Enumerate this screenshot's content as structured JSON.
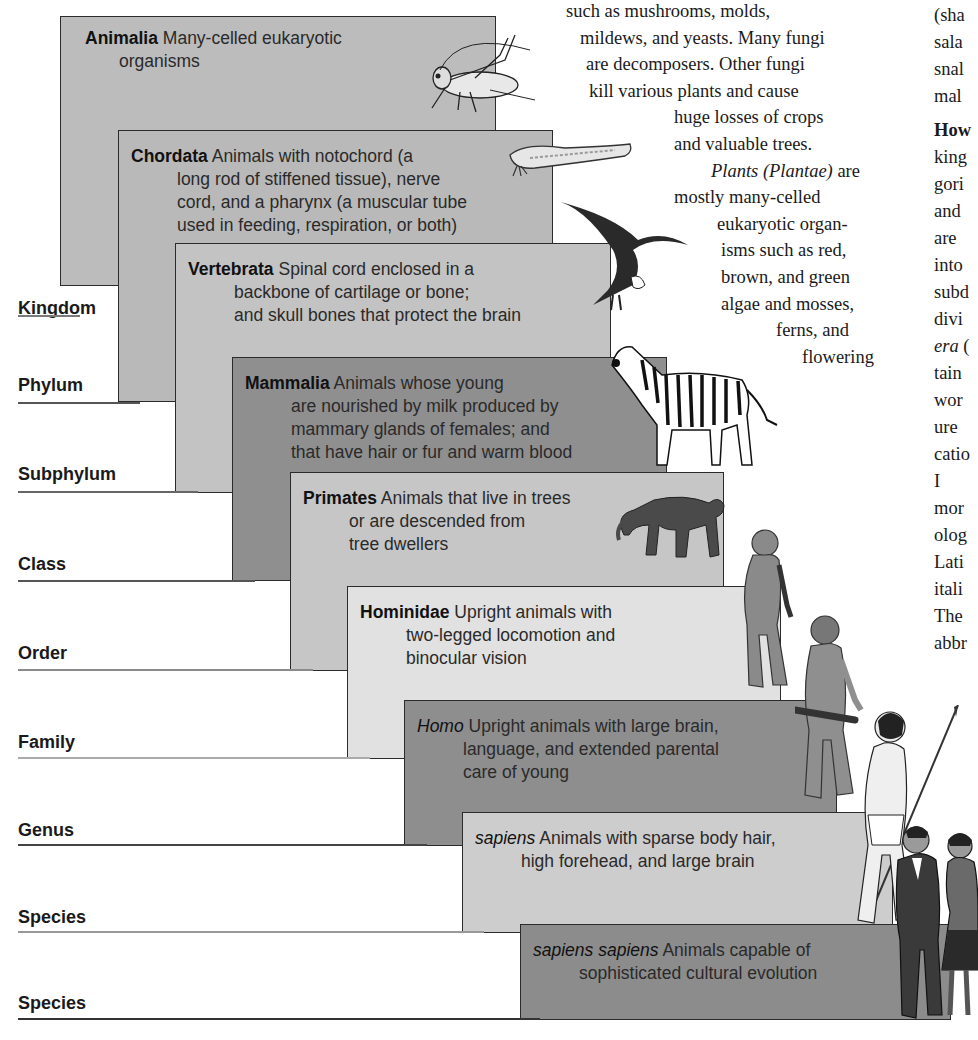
{
  "ranks": [
    {
      "label": "Kingdom",
      "y": 298,
      "underline_y": 315,
      "underline_w": 30,
      "underline_color": "#7a7a7a"
    },
    {
      "label": "Phylum",
      "y": 375,
      "underline_y": 402,
      "underline_w": 90,
      "underline_color": "#555555"
    },
    {
      "label": "Subphylum",
      "y": 464,
      "underline_y": 491,
      "underline_w": 148,
      "underline_color": "#666666"
    },
    {
      "label": "Class",
      "y": 554,
      "underline_y": 580,
      "underline_w": 205,
      "underline_color": "#555555"
    },
    {
      "label": "Order",
      "y": 643,
      "underline_y": 669,
      "underline_w": 263,
      "underline_color": "#8a8a8a"
    },
    {
      "label": "Family",
      "y": 732,
      "underline_y": 757,
      "underline_w": 320,
      "underline_color": "#aaaaaa"
    },
    {
      "label": "Genus",
      "y": 820,
      "underline_y": 844,
      "underline_w": 377,
      "underline_color": "#444444"
    },
    {
      "label": "Species",
      "y": 907,
      "underline_y": 931,
      "underline_w": 434,
      "underline_color": "#999999"
    },
    {
      "label": "Species",
      "y": 993,
      "underline_y": 1018,
      "underline_w": 490,
      "underline_color": "#333333"
    }
  ],
  "boxes": [
    {
      "term": "Animalia",
      "italic": false,
      "lines": [
        "Many-celled eukaryotic",
        "organisms"
      ],
      "x": 60,
      "y": 16,
      "w": 436,
      "h": 270,
      "fill": "#bcbcbc"
    },
    {
      "term": "Chordata",
      "italic": false,
      "lines": [
        "Animals with notochord (a",
        "long rod of stiffened tissue), nerve",
        "cord, and a pharynx (a muscular tube",
        "used in feeding, respiration, or both)"
      ],
      "x": 118,
      "y": 130,
      "w": 435,
      "h": 272,
      "fill": "#b9b9b9"
    },
    {
      "term": "Vertebrata",
      "italic": false,
      "lines": [
        "Spinal cord enclosed in a",
        "backbone of cartilage or bone;",
        "and skull bones that protect the brain"
      ],
      "x": 175,
      "y": 243,
      "w": 436,
      "h": 250,
      "fill": "#c3c3c3"
    },
    {
      "term": "Mammalia",
      "italic": false,
      "lines": [
        "Animals whose young",
        "are nourished by milk produced by",
        "mammary glands of females; and",
        "that have hair or fur and warm blood"
      ],
      "x": 232,
      "y": 357,
      "w": 435,
      "h": 224,
      "fill": "#8f8f8f"
    },
    {
      "term": "Primates",
      "italic": false,
      "lines": [
        "Animals that live in trees",
        "or are descended from",
        "tree dwellers"
      ],
      "x": 290,
      "y": 472,
      "w": 434,
      "h": 199,
      "fill": "#c6c6c6"
    },
    {
      "term": "Hominidae",
      "italic": false,
      "lines": [
        "Upright animals with",
        "two-legged locomotion and",
        "binocular vision"
      ],
      "x": 347,
      "y": 586,
      "w": 434,
      "h": 173,
      "fill": "#e1e1e1"
    },
    {
      "term": "Homo",
      "italic": true,
      "lines": [
        "Upright animals with large brain,",
        "language, and extended parental",
        "care of young"
      ],
      "x": 404,
      "y": 700,
      "w": 433,
      "h": 146,
      "fill": "#8e8e8e"
    },
    {
      "term": "sapiens",
      "italic": true,
      "lines": [
        "Animals with sparse body hair,",
        "high forehead, and large brain"
      ],
      "x": 462,
      "y": 812,
      "w": 431,
      "h": 121,
      "fill": "#cdcdcd"
    },
    {
      "term": "sapiens sapiens",
      "italic": true,
      "lines": [
        "Animals capable of",
        "sophisticated cultural evolution"
      ],
      "x": 520,
      "y": 924,
      "w": 431,
      "h": 96,
      "fill": "#8c8c8c"
    }
  ],
  "center_text": {
    "lines": [
      {
        "text": "such as mushrooms, molds,",
        "x": 566
      },
      {
        "text": "mildews, and yeasts. Many fungi",
        "x": 580
      },
      {
        "text": "are decomposers. Other fungi",
        "x": 586
      },
      {
        "text": "kill various plants and cause",
        "x": 589
      },
      {
        "text": "huge losses of crops",
        "x": 674
      },
      {
        "text": "and valuable trees.",
        "x": 674
      },
      {
        "text_it": "Plants (Plantae)",
        "text_rest": " are",
        "x": 711
      },
      {
        "text": "mostly many-celled",
        "x": 674
      },
      {
        "text": "eukaryotic organ-",
        "x": 717
      },
      {
        "text": "isms such as red,",
        "x": 721
      },
      {
        "text": "brown, and green",
        "x": 721
      },
      {
        "text": "algae and mosses,",
        "x": 721
      },
      {
        "text": "ferns, and",
        "x": 776
      },
      {
        "text": "flowering",
        "x": 802
      }
    ]
  },
  "right_text": {
    "lines": [
      {
        "text": "(sha",
        "y": 2
      },
      {
        "text": "sala",
        "y": 29
      },
      {
        "text": "snal",
        "y": 56
      },
      {
        "text": "mal",
        "y": 83
      },
      {
        "text_bold": "How",
        "y": 117
      },
      {
        "text": "king",
        "y": 144
      },
      {
        "text": "gori",
        "y": 171
      },
      {
        "text": "and",
        "y": 198
      },
      {
        "text": "are",
        "y": 225
      },
      {
        "text": "into",
        "y": 252
      },
      {
        "text": "subd",
        "y": 279
      },
      {
        "text": "divi",
        "y": 306
      },
      {
        "text_it": "era",
        "text_rest": " (",
        "y": 333
      },
      {
        "text": "tain",
        "y": 360
      },
      {
        "text": "wor",
        "y": 387
      },
      {
        "text": "ure",
        "y": 414
      },
      {
        "text": "catio",
        "y": 441
      },
      {
        "text": "  I",
        "y": 468
      },
      {
        "text": "mor",
        "y": 495
      },
      {
        "text": "olog",
        "y": 522
      },
      {
        "text": "Lati",
        "y": 549
      },
      {
        "text": "itali",
        "y": 576
      },
      {
        "text": "The",
        "y": 603
      },
      {
        "text": "abbr",
        "y": 630
      }
    ]
  },
  "illustrations": [
    "cricket",
    "lancelet",
    "eagle",
    "zebra",
    "monkey",
    "early-hominid",
    "neanderthal-with-club",
    "early-human-with-spear",
    "modern-man-and-woman"
  ]
}
